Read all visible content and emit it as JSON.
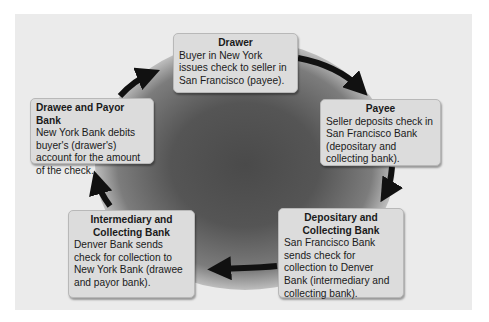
{
  "diagram": {
    "type": "cycle",
    "nodes": [
      {
        "id": "drawer",
        "title": "Drawer",
        "body": "Buyer in New York issues check to seller in San Francisco (payee)."
      },
      {
        "id": "payee",
        "title": "Payee",
        "body": "Seller deposits check in San Francisco Bank (depositary and collecting bank)."
      },
      {
        "id": "depositary",
        "title": "Depositary and Collecting Bank",
        "body": "San Francisco Bank sends check for collection to Denver Bank (intermediary and collecting bank)."
      },
      {
        "id": "intermediary",
        "title": "Intermediary and Collecting Bank",
        "body": "Denver Bank sends check for collection to New York Bank (drawee and payor bank)."
      },
      {
        "id": "drawee",
        "title": "Drawee and Payor Bank",
        "body": "New York Bank debits buyer's (drawer's) account for the amount of the check."
      }
    ],
    "edges": [
      {
        "from": "drawer",
        "to": "payee"
      },
      {
        "from": "payee",
        "to": "depositary"
      },
      {
        "from": "depositary",
        "to": "intermediary"
      },
      {
        "from": "intermediary",
        "to": "drawee"
      },
      {
        "from": "drawee",
        "to": "drawer"
      }
    ],
    "colors": {
      "panel": "#ebebeb",
      "box": "#dcdcdc",
      "arrow": "#111111",
      "center": "#4a4a4a"
    }
  }
}
